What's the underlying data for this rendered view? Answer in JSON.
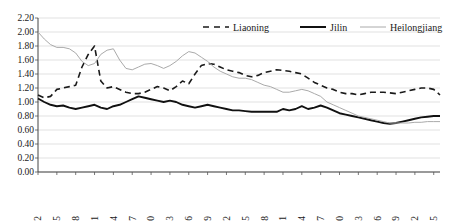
{
  "chart_data": {
    "type": "line",
    "title": "",
    "xlabel": "",
    "ylabel": "",
    "ylim": [
      0.0,
      2.2
    ],
    "ytick_step": 0.2,
    "grid": true,
    "legend_position": "top-right",
    "ytick_labels": [
      "0.00",
      "0.20",
      "0.40",
      "0.60",
      "0.80",
      "1.00",
      "1.20",
      "1.40",
      "1.60",
      "1.80",
      "2.00",
      "2.20"
    ],
    "xtick_labels": [
      "1952",
      "1955",
      "1958",
      "1961",
      "1964",
      "1967",
      "1970",
      "1973",
      "1976",
      "1979",
      "1982",
      "1985",
      "1988",
      "1991",
      "1994",
      "1997",
      "2000",
      "2003",
      "2006",
      "2009",
      "2012",
      "2015"
    ],
    "x_start": 1952,
    "x_end": 2016,
    "x": [
      1952,
      1953,
      1954,
      1955,
      1956,
      1957,
      1958,
      1959,
      1960,
      1961,
      1962,
      1963,
      1964,
      1965,
      1966,
      1967,
      1968,
      1969,
      1970,
      1971,
      1972,
      1973,
      1974,
      1975,
      1976,
      1977,
      1978,
      1979,
      1980,
      1981,
      1982,
      1983,
      1984,
      1985,
      1986,
      1987,
      1988,
      1989,
      1990,
      1991,
      1992,
      1993,
      1994,
      1995,
      1996,
      1997,
      1998,
      1999,
      2000,
      2001,
      2002,
      2003,
      2004,
      2005,
      2006,
      2007,
      2008,
      2009,
      2010,
      2011,
      2012,
      2013,
      2014,
      2015,
      2016
    ],
    "series": [
      {
        "name": "Liaoning",
        "style": "dashed",
        "color": "#1a1a1a",
        "values": [
          1.1,
          1.06,
          1.08,
          1.18,
          1.2,
          1.22,
          1.24,
          1.5,
          1.68,
          1.8,
          1.3,
          1.2,
          1.22,
          1.18,
          1.14,
          1.12,
          1.12,
          1.14,
          1.18,
          1.22,
          1.2,
          1.16,
          1.22,
          1.3,
          1.26,
          1.4,
          1.52,
          1.55,
          1.54,
          1.5,
          1.46,
          1.44,
          1.42,
          1.38,
          1.36,
          1.38,
          1.42,
          1.44,
          1.46,
          1.45,
          1.44,
          1.42,
          1.4,
          1.34,
          1.28,
          1.24,
          1.2,
          1.18,
          1.14,
          1.12,
          1.12,
          1.1,
          1.12,
          1.14,
          1.14,
          1.14,
          1.13,
          1.12,
          1.14,
          1.16,
          1.18,
          1.2,
          1.2,
          1.18,
          1.1
        ]
      },
      {
        "name": "Jilin",
        "style": "solid-thick",
        "color": "#111111",
        "values": [
          1.05,
          1.0,
          0.96,
          0.94,
          0.95,
          0.92,
          0.9,
          0.92,
          0.94,
          0.96,
          0.92,
          0.9,
          0.94,
          0.96,
          1.0,
          1.04,
          1.08,
          1.06,
          1.04,
          1.02,
          1.0,
          1.02,
          1.0,
          0.96,
          0.94,
          0.92,
          0.94,
          0.96,
          0.94,
          0.92,
          0.9,
          0.88,
          0.88,
          0.87,
          0.86,
          0.86,
          0.86,
          0.86,
          0.86,
          0.9,
          0.88,
          0.9,
          0.94,
          0.9,
          0.92,
          0.95,
          0.92,
          0.88,
          0.84,
          0.82,
          0.8,
          0.78,
          0.76,
          0.74,
          0.72,
          0.7,
          0.69,
          0.7,
          0.72,
          0.74,
          0.76,
          0.78,
          0.79,
          0.8,
          0.8
        ]
      },
      {
        "name": "Heilongjiang",
        "style": "solid-thin",
        "color": "#aaaaaa",
        "values": [
          2.0,
          1.9,
          1.82,
          1.78,
          1.78,
          1.76,
          1.7,
          1.58,
          1.52,
          1.55,
          1.68,
          1.74,
          1.76,
          1.6,
          1.48,
          1.46,
          1.5,
          1.54,
          1.55,
          1.52,
          1.48,
          1.52,
          1.58,
          1.66,
          1.72,
          1.7,
          1.64,
          1.58,
          1.5,
          1.44,
          1.4,
          1.36,
          1.34,
          1.34,
          1.32,
          1.28,
          1.24,
          1.22,
          1.18,
          1.14,
          1.14,
          1.16,
          1.18,
          1.16,
          1.12,
          1.08,
          1.0,
          0.96,
          0.92,
          0.88,
          0.84,
          0.8,
          0.78,
          0.76,
          0.74,
          0.72,
          0.7,
          0.7,
          0.7,
          0.7,
          0.71,
          0.71,
          0.72,
          0.72,
          0.72
        ]
      }
    ]
  },
  "legend": {
    "items": [
      {
        "label": "Liaoning"
      },
      {
        "label": "Jilin"
      },
      {
        "label": "Heilongjiang"
      }
    ]
  }
}
